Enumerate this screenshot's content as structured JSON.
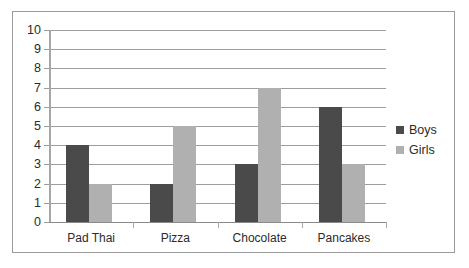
{
  "chart_data": {
    "type": "bar",
    "title": "",
    "xlabel": "",
    "ylabel": "",
    "ylim": [
      0,
      10
    ],
    "ytick_step": 1,
    "grid": true,
    "legend_position": "right",
    "categories": [
      "Pad Thai",
      "Pizza",
      "Chocolate",
      "Pancakes"
    ],
    "ytick_labels": [
      "10",
      "9",
      "8",
      "7",
      "6",
      "5",
      "4",
      "3",
      "2",
      "1",
      "0"
    ],
    "series": [
      {
        "name": "Boys",
        "color": "#4a4a4a",
        "values": [
          4,
          2,
          3,
          6
        ]
      },
      {
        "name": "Girls",
        "color": "#b0b0b0",
        "values": [
          2,
          5,
          7,
          3
        ]
      }
    ]
  },
  "legend": {
    "items": [
      {
        "label": "Boys",
        "color": "#4a4a4a",
        "swatch_name": "legend-swatch-boys"
      },
      {
        "label": "Girls",
        "color": "#b0b0b0",
        "swatch_name": "legend-swatch-girls"
      }
    ]
  },
  "frame": {
    "border_color": "#9a9a9a",
    "background": "#ffffff",
    "gridline_color": "#9d9d9d"
  }
}
